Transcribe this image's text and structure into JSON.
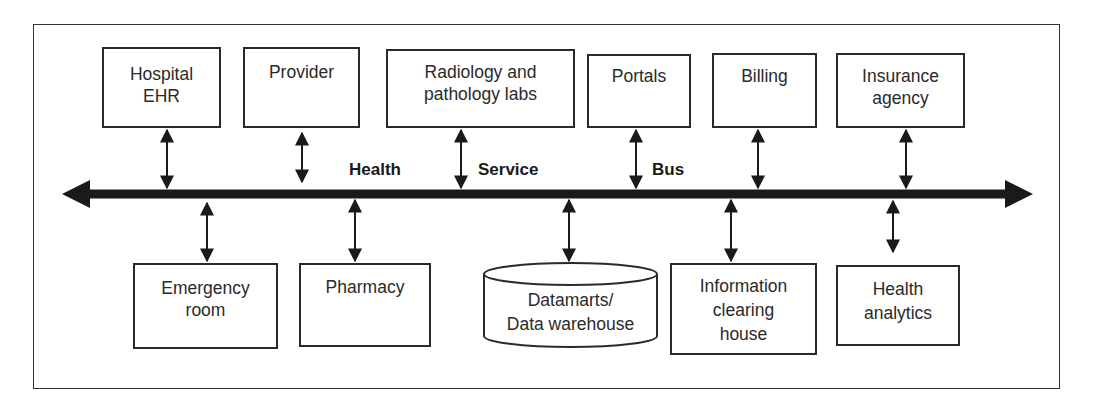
{
  "diagram": {
    "bus": {
      "labels": [
        "Health",
        "Service",
        "Bus"
      ],
      "direction": "bidirectional"
    },
    "top_nodes": [
      {
        "id": "hospital-ehr",
        "lines": [
          "Hospital",
          "EHR"
        ]
      },
      {
        "id": "provider",
        "lines": [
          "Provider"
        ]
      },
      {
        "id": "radiology",
        "lines": [
          "Radiology and",
          "pathology labs"
        ]
      },
      {
        "id": "portals",
        "lines": [
          "Portals"
        ]
      },
      {
        "id": "billing",
        "lines": [
          "Billing"
        ]
      },
      {
        "id": "insurance",
        "lines": [
          "Insurance",
          "agency"
        ]
      }
    ],
    "bottom_nodes": [
      {
        "id": "emergency-room",
        "lines": [
          "Emergency",
          "room"
        ]
      },
      {
        "id": "pharmacy",
        "lines": [
          "Pharmacy"
        ]
      },
      {
        "id": "datamarts",
        "lines": [
          "Datamarts/",
          "Data warehouse"
        ],
        "shape": "cylinder"
      },
      {
        "id": "info-clearing-house",
        "lines": [
          "Information",
          "clearing",
          "house"
        ]
      },
      {
        "id": "health-analytics",
        "lines": [
          "Health",
          "analytics"
        ]
      }
    ],
    "colors": {
      "stroke": "#1a1a1a",
      "background": "#ffffff"
    }
  }
}
